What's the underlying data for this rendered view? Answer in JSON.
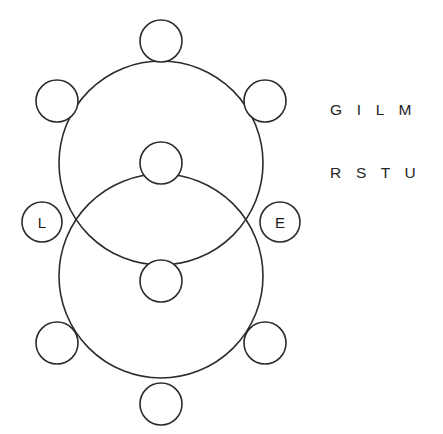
{
  "figure": {
    "background_color": "#ffffff",
    "stroke_color": "#2b2b2b"
  },
  "side_text": {
    "line1": "G I L M",
    "line2": "R S T U"
  },
  "labels": {
    "left_circle": "L",
    "right_circle": "E",
    "top_circle": "",
    "upper_left_circle": "",
    "upper_right_circle": "",
    "upper_center_circle": "",
    "lower_center_circle": "",
    "lower_left_circle": "",
    "lower_right_circle": "",
    "bottom_circle": ""
  },
  "geometry": {
    "large_circles": [
      {
        "name": "upper-large-circle",
        "cx": 161,
        "cy": 163,
        "r": 102
      },
      {
        "name": "lower-large-circle",
        "cx": 161,
        "cy": 276,
        "r": 102
      }
    ],
    "small_circles": [
      {
        "name": "top-circle",
        "cx": 161,
        "cy": 41,
        "r": 21
      },
      {
        "name": "upper-left-circle",
        "cx": 57,
        "cy": 101,
        "r": 21
      },
      {
        "name": "upper-right-circle",
        "cx": 265,
        "cy": 101,
        "r": 21
      },
      {
        "name": "upper-center-circle",
        "cx": 161,
        "cy": 163,
        "r": 21
      },
      {
        "name": "left-circle",
        "cx": 42,
        "cy": 222,
        "r": 20
      },
      {
        "name": "right-circle",
        "cx": 280,
        "cy": 222,
        "r": 20
      },
      {
        "name": "lower-center-circle",
        "cx": 161,
        "cy": 281,
        "r": 21
      },
      {
        "name": "lower-left-circle",
        "cx": 57,
        "cy": 343,
        "r": 21
      },
      {
        "name": "lower-right-circle",
        "cx": 265,
        "cy": 343,
        "r": 21
      },
      {
        "name": "bottom-circle",
        "cx": 161,
        "cy": 404,
        "r": 21
      }
    ]
  }
}
